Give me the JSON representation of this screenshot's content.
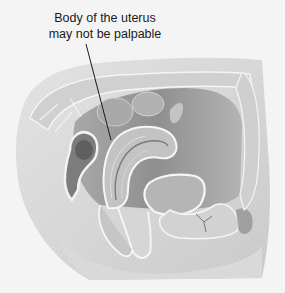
{
  "annotation": {
    "lines": [
      "Body of the uterus",
      "may not be palpable"
    ],
    "leader_from": [
      86,
      44
    ],
    "leader_to": [
      111,
      140
    ]
  },
  "illustration": {
    "subject": "sagittal section of female pelvis",
    "style": "grayscale anatomical illustration",
    "colors": {
      "background": "#f4f4f4",
      "tissue_light": "#dcdcdc",
      "tissue_mid": "#b8b8b8",
      "tissue_dark": "#8a8a8a",
      "outline": "#f7f7f7",
      "leader": "#1a1a1a"
    }
  }
}
